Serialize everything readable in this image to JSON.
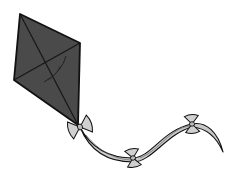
{
  "image": {
    "subject": "Kite with ribbon tail and bows",
    "colors": {
      "background": "#ffffff",
      "kite_fill": "#4a4a4a",
      "outline": "#111111",
      "ribbon_fill": "#c8c8c8",
      "bow_fill": "#d0d0d0"
    },
    "kite": {
      "top": [
        20,
        14
      ],
      "right": [
        80,
        43
      ],
      "left": [
        14,
        80
      ],
      "bottom": [
        78,
        125
      ]
    },
    "bows": [
      {
        "cx": 80,
        "cy": 127
      },
      {
        "cx": 133,
        "cy": 158
      },
      {
        "cx": 192,
        "cy": 124
      }
    ]
  }
}
